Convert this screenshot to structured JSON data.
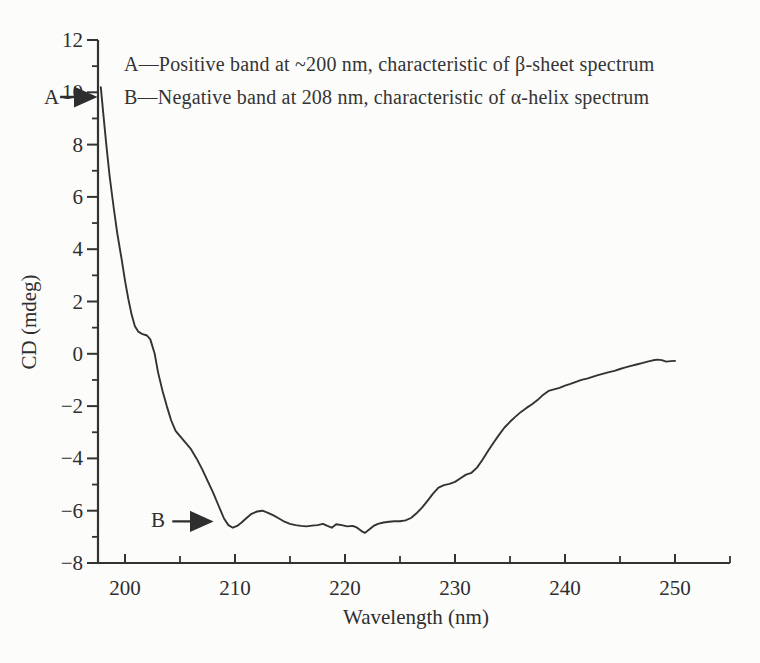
{
  "figure": {
    "background": "#fcfcfa",
    "ink_color": "#333333"
  },
  "annotations_text": {
    "line1": "A—Positive band at ~200 nm, characteristic of β-sheet spectrum",
    "line2": "B—Negative band at 208 nm, characteristic of α-helix spectrum"
  },
  "chart_data": {
    "type": "line",
    "title": "",
    "xlabel": "Wavelength (nm)",
    "ylabel": "CD (mdeg)",
    "xlim": [
      197.5,
      255
    ],
    "ylim": [
      -8,
      12
    ],
    "grid": false,
    "legend": null,
    "x_major_ticks": [
      200,
      210,
      220,
      230,
      240,
      250
    ],
    "x_minor_ticks": [
      205,
      215,
      225,
      235,
      245,
      255
    ],
    "y_major_ticks": [
      -8,
      -6,
      -4,
      -2,
      0,
      2,
      4,
      6,
      8,
      10,
      12
    ],
    "y_minor_ticks": [
      -7,
      -5,
      -3,
      -1,
      1,
      3,
      5,
      7,
      9,
      11
    ],
    "annotations": [
      {
        "label": "A",
        "arrow": {
          "from": [
            194.1,
            9.82
          ],
          "to": [
            197.45,
            9.82
          ]
        }
      },
      {
        "label": "B",
        "arrow": {
          "from": [
            204.3,
            -6.41
          ],
          "to": [
            208.0,
            -6.41
          ]
        }
      }
    ],
    "series": [
      {
        "color": "#333333",
        "points": [
          [
            197.8,
            10.2
          ],
          [
            198.0,
            9.3
          ],
          [
            198.3,
            8.0
          ],
          [
            198.6,
            6.8
          ],
          [
            199.0,
            5.5
          ],
          [
            199.3,
            4.6
          ],
          [
            199.7,
            3.6
          ],
          [
            200.0,
            2.8
          ],
          [
            200.3,
            2.1
          ],
          [
            200.6,
            1.5
          ],
          [
            200.9,
            1.05
          ],
          [
            201.2,
            0.85
          ],
          [
            201.6,
            0.75
          ],
          [
            202.0,
            0.7
          ],
          [
            202.3,
            0.55
          ],
          [
            202.7,
            0.0
          ],
          [
            203.0,
            -0.7
          ],
          [
            203.4,
            -1.4
          ],
          [
            203.8,
            -2.0
          ],
          [
            204.2,
            -2.55
          ],
          [
            204.6,
            -2.95
          ],
          [
            205.0,
            -3.15
          ],
          [
            205.5,
            -3.4
          ],
          [
            206.0,
            -3.65
          ],
          [
            206.5,
            -4.0
          ],
          [
            207.0,
            -4.4
          ],
          [
            207.5,
            -4.85
          ],
          [
            208.0,
            -5.3
          ],
          [
            208.5,
            -5.8
          ],
          [
            209.0,
            -6.3
          ],
          [
            209.4,
            -6.55
          ],
          [
            209.8,
            -6.65
          ],
          [
            210.2,
            -6.58
          ],
          [
            210.6,
            -6.45
          ],
          [
            211.0,
            -6.3
          ],
          [
            211.5,
            -6.12
          ],
          [
            212.0,
            -6.03
          ],
          [
            212.5,
            -6.0
          ],
          [
            213.0,
            -6.08
          ],
          [
            213.5,
            -6.18
          ],
          [
            214.0,
            -6.3
          ],
          [
            214.5,
            -6.42
          ],
          [
            215.0,
            -6.5
          ],
          [
            215.5,
            -6.55
          ],
          [
            216.0,
            -6.58
          ],
          [
            216.5,
            -6.6
          ],
          [
            217.0,
            -6.57
          ],
          [
            217.5,
            -6.55
          ],
          [
            218.0,
            -6.5
          ],
          [
            218.4,
            -6.58
          ],
          [
            218.8,
            -6.65
          ],
          [
            219.2,
            -6.52
          ],
          [
            219.7,
            -6.55
          ],
          [
            220.2,
            -6.6
          ],
          [
            220.7,
            -6.58
          ],
          [
            221.1,
            -6.65
          ],
          [
            221.5,
            -6.78
          ],
          [
            221.8,
            -6.85
          ],
          [
            222.2,
            -6.72
          ],
          [
            222.6,
            -6.58
          ],
          [
            223.0,
            -6.5
          ],
          [
            223.5,
            -6.45
          ],
          [
            224.0,
            -6.42
          ],
          [
            224.5,
            -6.4
          ],
          [
            225.0,
            -6.4
          ],
          [
            225.5,
            -6.37
          ],
          [
            226.0,
            -6.28
          ],
          [
            226.5,
            -6.1
          ],
          [
            227.0,
            -5.88
          ],
          [
            227.5,
            -5.62
          ],
          [
            228.0,
            -5.35
          ],
          [
            228.5,
            -5.12
          ],
          [
            229.0,
            -5.02
          ],
          [
            229.5,
            -4.97
          ],
          [
            230.0,
            -4.9
          ],
          [
            230.5,
            -4.76
          ],
          [
            231.0,
            -4.62
          ],
          [
            231.5,
            -4.55
          ],
          [
            232.0,
            -4.35
          ],
          [
            232.5,
            -4.05
          ],
          [
            233.0,
            -3.72
          ],
          [
            233.5,
            -3.4
          ],
          [
            234.0,
            -3.1
          ],
          [
            234.5,
            -2.82
          ],
          [
            235.0,
            -2.6
          ],
          [
            235.5,
            -2.4
          ],
          [
            236.0,
            -2.22
          ],
          [
            236.5,
            -2.07
          ],
          [
            237.0,
            -1.93
          ],
          [
            237.5,
            -1.77
          ],
          [
            238.0,
            -1.57
          ],
          [
            238.5,
            -1.42
          ],
          [
            239.0,
            -1.36
          ],
          [
            239.5,
            -1.3
          ],
          [
            240.0,
            -1.22
          ],
          [
            240.5,
            -1.15
          ],
          [
            241.0,
            -1.07
          ],
          [
            241.5,
            -1.0
          ],
          [
            242.0,
            -0.95
          ],
          [
            242.5,
            -0.88
          ],
          [
            243.0,
            -0.82
          ],
          [
            243.5,
            -0.76
          ],
          [
            244.0,
            -0.7
          ],
          [
            244.5,
            -0.65
          ],
          [
            245.0,
            -0.58
          ],
          [
            245.5,
            -0.52
          ],
          [
            246.0,
            -0.46
          ],
          [
            246.5,
            -0.41
          ],
          [
            247.0,
            -0.36
          ],
          [
            247.5,
            -0.3
          ],
          [
            248.0,
            -0.25
          ],
          [
            248.4,
            -0.22
          ],
          [
            248.8,
            -0.24
          ],
          [
            249.2,
            -0.3
          ],
          [
            249.6,
            -0.28
          ],
          [
            250.0,
            -0.27
          ]
        ]
      }
    ]
  }
}
